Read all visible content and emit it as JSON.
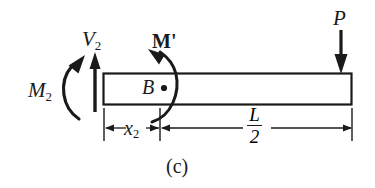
{
  "figure": {
    "caption": "(c)",
    "type": "free-body-diagram"
  },
  "labels": {
    "shear_force": "V",
    "shear_force_sub": "2",
    "moment_left": "M",
    "moment_left_sub": "2",
    "internal_moment": "M'",
    "point_b": "B",
    "load": "P",
    "dim_x2": "x",
    "dim_x2_sub": "2",
    "dim_L_numerator": "L",
    "dim_L_denominator": "2"
  },
  "colors": {
    "ink": "#1a1a1a",
    "beam_fill": "#ffffff",
    "background": "#ffffff"
  },
  "geometry": {
    "beam_left": 103,
    "beam_right": 352,
    "beam_top": 73,
    "beam_bottom": 105,
    "x2_dimension_start": 104,
    "x2_dimension_end": 160,
    "half_L_dimension_start": 160,
    "half_L_dimension_end": 352,
    "dimension_line_y": 128
  }
}
